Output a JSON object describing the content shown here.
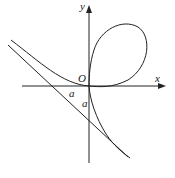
{
  "diagram": {
    "labels": {
      "y_axis": "y",
      "x_axis": "x",
      "origin": "O",
      "a_horizontal": "a",
      "a_vertical": "a"
    },
    "colors": {
      "stroke": "#222222",
      "background": "#ffffff"
    }
  }
}
